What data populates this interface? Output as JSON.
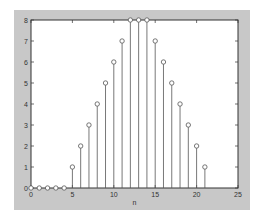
{
  "chart_data": {
    "type": "stem",
    "title": "",
    "xlabel": "n",
    "ylabel": "",
    "x": [
      0,
      1,
      2,
      3,
      4,
      5,
      6,
      7,
      8,
      9,
      10,
      11,
      12,
      13,
      14,
      15,
      16,
      17,
      18,
      19,
      20,
      21
    ],
    "values": [
      0,
      0,
      0,
      0,
      0,
      1,
      2,
      3,
      4,
      5,
      6,
      7,
      8,
      8,
      8,
      7,
      6,
      5,
      4,
      3,
      2,
      1
    ],
    "xlim": [
      0,
      25
    ],
    "ylim": [
      0,
      8
    ],
    "xticks": [
      0,
      5,
      10,
      15,
      20,
      25
    ],
    "yticks": [
      0,
      1,
      2,
      3,
      4,
      5,
      6,
      7,
      8
    ],
    "grid": false,
    "marker": "circle-open",
    "colors": {
      "stem": "#555555",
      "figure_bg": "#c8c8c8",
      "axes_bg": "#ffffff"
    }
  }
}
